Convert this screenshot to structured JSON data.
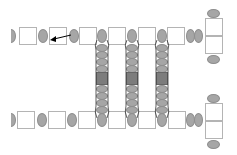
{
  "diagram": {
    "colors": {
      "oval_fill": "#a6a6a6",
      "square_border": "#b4b4b4",
      "dark_segment": "#7c7c7c",
      "arrow": "#000000",
      "background": "#ffffff"
    },
    "top_chain": {
      "y": 28,
      "elements": [
        "half-oval",
        "square",
        "oval",
        "square",
        "oval",
        "square",
        "ladder-oval",
        "square",
        "ladder-oval",
        "square",
        "ladder-oval",
        "square",
        "oval",
        "oval",
        "double-box"
      ]
    },
    "bottom_chain": {
      "y": 112,
      "elements": [
        "half-oval",
        "square",
        "oval",
        "square",
        "oval",
        "square",
        "ladder-oval",
        "square",
        "ladder-oval",
        "square",
        "ladder-oval",
        "square",
        "oval",
        "oval",
        "double-box"
      ]
    },
    "ladders": [
      {
        "x": 97,
        "ovals_above_block": 4,
        "ovals_below_block": 4
      },
      {
        "x": 127,
        "ovals_above_block": 4,
        "ovals_below_block": 4
      },
      {
        "x": 157,
        "ovals_above_block": 4,
        "ovals_below_block": 4
      }
    ],
    "arrow": {
      "from": "oval at x 73",
      "to": "square at x 49",
      "direction": "left"
    }
  }
}
